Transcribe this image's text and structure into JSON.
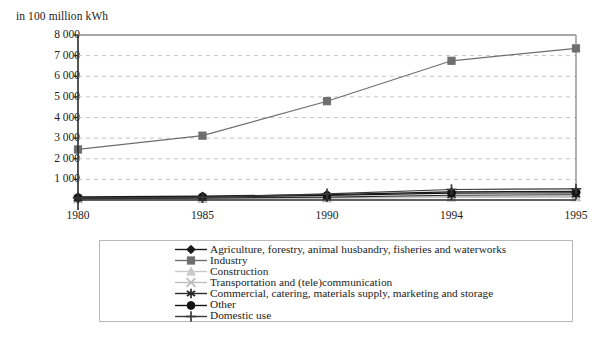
{
  "chart_data": {
    "type": "line",
    "title": "",
    "subtitle": "",
    "unit_label": "in 100 million kWh",
    "xlabel": "",
    "ylabel": "",
    "x": [
      "1980",
      "1985",
      "1990",
      "1994",
      "1995"
    ],
    "categories": [
      "1980",
      "1985",
      "1990",
      "1994",
      "1995"
    ],
    "ylim": [
      0,
      8000
    ],
    "ytick_labels": [
      "0",
      "1 000",
      "2 000",
      "3 000",
      "4 000",
      "5 000",
      "6 000",
      "7 000",
      "8 000"
    ],
    "ytick_values": [
      0,
      1000,
      2000,
      3000,
      4000,
      5000,
      6000,
      7000,
      8000
    ],
    "grid": "horizontal-dashed",
    "legend_position": "bottom",
    "series": [
      {
        "name": "Agriculture, forestry, animal husbandry, fisheries and waterworks",
        "marker": "diamond",
        "color": "#1a1a1a",
        "values": [
          150,
          190,
          260,
          390,
          420
        ]
      },
      {
        "name": "Industry",
        "marker": "square",
        "color": "#6e6e6e",
        "values": [
          2450,
          3120,
          4790,
          6750,
          7350
        ]
      },
      {
        "name": "Construction",
        "marker": "triangle",
        "color": "#c9c9c9",
        "values": [
          40,
          55,
          80,
          120,
          130
        ]
      },
      {
        "name": "Transportation and (tele)communication",
        "marker": "cross-x",
        "color": "#bdbdbd",
        "values": [
          60,
          80,
          110,
          160,
          175
        ]
      },
      {
        "name": "Commercial, catering, materials supply, marketing and storage",
        "marker": "asterisk",
        "color": "#2a2a2a",
        "values": [
          70,
          95,
          140,
          230,
          255
        ]
      },
      {
        "name": "Other",
        "marker": "circle",
        "color": "#141414",
        "values": [
          110,
          150,
          220,
          330,
          350
        ]
      },
      {
        "name": "Domestic use",
        "marker": "plus",
        "color": "#3a3a3a",
        "values": [
          100,
          130,
          300,
          510,
          540
        ]
      }
    ]
  }
}
